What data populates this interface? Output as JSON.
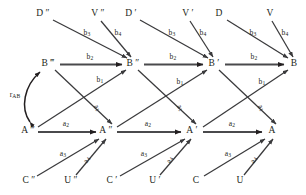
{
  "figure": {
    "background_color": "#ffffff",
    "line_color": "#231f20",
    "text_color": "#231f20"
  },
  "nodes": [
    {
      "id": "D2",
      "label": "D ″",
      "x": 43,
      "y": 14
    },
    {
      "id": "V2",
      "label": "V ″",
      "x": 98,
      "y": 14
    },
    {
      "id": "D1",
      "label": "D ′",
      "x": 131,
      "y": 14
    },
    {
      "id": "V1",
      "label": "V ′",
      "x": 188,
      "y": 14
    },
    {
      "id": "D0",
      "label": "D",
      "x": 219,
      "y": 14
    },
    {
      "id": "V0",
      "label": "V",
      "x": 270,
      "y": 14
    },
    {
      "id": "B3",
      "label": "B ‴",
      "x": 48,
      "y": 64
    },
    {
      "id": "B2",
      "label": "B ″",
      "x": 133,
      "y": 64
    },
    {
      "id": "B1",
      "label": "B ′",
      "x": 214,
      "y": 64
    },
    {
      "id": "B0",
      "label": "B",
      "x": 294,
      "y": 64
    },
    {
      "id": "A3",
      "label": "A ‴",
      "x": 28,
      "y": 131
    },
    {
      "id": "A2",
      "label": "A ″",
      "x": 106,
      "y": 131
    },
    {
      "id": "A1",
      "label": "A ′",
      "x": 192,
      "y": 131
    },
    {
      "id": "A0",
      "label": "A",
      "x": 272,
      "y": 131
    },
    {
      "id": "C2",
      "label": "C ″",
      "x": 29,
      "y": 181
    },
    {
      "id": "U2",
      "label": "U ″",
      "x": 71,
      "y": 181
    },
    {
      "id": "C1",
      "label": "C ′",
      "x": 112,
      "y": 181
    },
    {
      "id": "U1",
      "label": "U ′",
      "x": 155,
      "y": 181
    },
    {
      "id": "C0",
      "label": "C",
      "x": 196,
      "y": 181
    },
    {
      "id": "U0",
      "label": "U",
      "x": 240,
      "y": 181
    }
  ],
  "edges": [
    {
      "id": "e-b2-3",
      "from": "B3",
      "to": "B2",
      "coef": "b",
      "sub": "2",
      "weight": "bold"
    },
    {
      "id": "e-b2-2",
      "from": "B2",
      "to": "B1",
      "coef": "b",
      "sub": "2",
      "weight": "bold"
    },
    {
      "id": "e-b2-1",
      "from": "B1",
      "to": "B0",
      "coef": "b",
      "sub": "2",
      "weight": "bold"
    },
    {
      "id": "e-a2-3",
      "from": "A3",
      "to": "A2",
      "coef": "a",
      "sub": "2",
      "weight": "bold"
    },
    {
      "id": "e-a2-2",
      "from": "A2",
      "to": "A1",
      "coef": "a",
      "sub": "2",
      "weight": "bold"
    },
    {
      "id": "e-a2-1",
      "from": "A1",
      "to": "A0",
      "coef": "a",
      "sub": "2",
      "weight": "bold"
    },
    {
      "id": "e-b1-3",
      "from": "A3",
      "to": "B2",
      "coef": "b",
      "sub": "1",
      "weight": "thin"
    },
    {
      "id": "e-b1-2",
      "from": "A2",
      "to": "B1",
      "coef": "b",
      "sub": "1",
      "weight": "thin"
    },
    {
      "id": "e-b1-1",
      "from": "A1",
      "to": "B0",
      "coef": "b",
      "sub": "1",
      "weight": "thin"
    },
    {
      "id": "e-a1-3",
      "from": "B3",
      "to": "A2",
      "coef": "a",
      "sub": "1",
      "weight": "thin"
    },
    {
      "id": "e-a1-2",
      "from": "B2",
      "to": "A1",
      "coef": "a",
      "sub": "1",
      "weight": "thin"
    },
    {
      "id": "e-a1-1",
      "from": "B1",
      "to": "A0",
      "coef": "a",
      "sub": "1",
      "weight": "thin"
    },
    {
      "id": "e-b3-3",
      "from": "D2",
      "to": "B2",
      "coef": "b",
      "sub": "3",
      "weight": "thin"
    },
    {
      "id": "e-b3-2",
      "from": "D1",
      "to": "B1",
      "coef": "b",
      "sub": "3",
      "weight": "thin"
    },
    {
      "id": "e-b3-1",
      "from": "D0",
      "to": "B0",
      "coef": "b",
      "sub": "3",
      "weight": "thin"
    },
    {
      "id": "e-b4-3",
      "from": "V2",
      "to": "B2",
      "coef": "b",
      "sub": "4",
      "weight": "thin"
    },
    {
      "id": "e-b4-2",
      "from": "V1",
      "to": "B1",
      "coef": "b",
      "sub": "4",
      "weight": "thin"
    },
    {
      "id": "e-b4-1",
      "from": "V0",
      "to": "B0",
      "coef": "b",
      "sub": "4",
      "weight": "thin"
    },
    {
      "id": "e-a3-3",
      "from": "C2",
      "to": "A2",
      "coef": "a",
      "sub": "3",
      "weight": "thin"
    },
    {
      "id": "e-a3-2",
      "from": "C1",
      "to": "A1",
      "coef": "a",
      "sub": "3",
      "weight": "thin"
    },
    {
      "id": "e-a3-1",
      "from": "C0",
      "to": "A0",
      "coef": "a",
      "sub": "3",
      "weight": "thin"
    },
    {
      "id": "e-a4-3",
      "from": "U2",
      "to": "A2",
      "coef": "a",
      "sub": "4",
      "weight": "thin"
    },
    {
      "id": "e-a4-2",
      "from": "U1",
      "to": "A1",
      "coef": "a",
      "sub": "4",
      "weight": "thin"
    },
    {
      "id": "e-a4-1",
      "from": "U0",
      "to": "A0",
      "coef": "a",
      "sub": "4",
      "weight": "thin"
    },
    {
      "id": "e-rab",
      "from": "A3",
      "to": "B3",
      "coef": "r",
      "sub": "AB",
      "weight": "thin",
      "style": "curved-double"
    }
  ],
  "edge_labels": {
    "b2_col3": {
      "text": "b",
      "sub": "2",
      "x": 90,
      "y": 57
    },
    "b2_col2": {
      "text": "b",
      "sub": "2",
      "x": 173,
      "y": 57
    },
    "b2_col1": {
      "text": "b",
      "sub": "2",
      "x": 254,
      "y": 57
    },
    "a2_col3": {
      "text": "a",
      "sub": "2",
      "x": 66,
      "y": 124
    },
    "a2_col2": {
      "text": "a",
      "sub": "2",
      "x": 148,
      "y": 124
    },
    "a2_col1": {
      "text": "a",
      "sub": "2",
      "x": 232,
      "y": 124
    },
    "b1_col3": {
      "text": "b",
      "sub": "1",
      "x": 100,
      "y": 80
    },
    "b1_col2": {
      "text": "b",
      "sub": "1",
      "x": 180,
      "y": 82
    },
    "b1_col1": {
      "text": "b",
      "sub": "1",
      "x": 262,
      "y": 82
    },
    "a1_col3": {
      "text": "a",
      "sub": "1",
      "x": 97,
      "y": 108
    },
    "a1_col2": {
      "text": "a",
      "sub": "1",
      "x": 180,
      "y": 108
    },
    "a1_col1": {
      "text": "a",
      "sub": "1",
      "x": 261,
      "y": 108
    },
    "b3_col3": {
      "text": "b",
      "sub": "3",
      "x": 87,
      "y": 33
    },
    "b3_col2": {
      "text": "b",
      "sub": "3",
      "x": 172,
      "y": 33
    },
    "b3_col1": {
      "text": "b",
      "sub": "3",
      "x": 253,
      "y": 33
    },
    "b4_col3": {
      "text": "b",
      "sub": "4",
      "x": 118,
      "y": 33
    },
    "b4_col2": {
      "text": "b",
      "sub": "4",
      "x": 203,
      "y": 33
    },
    "b4_col1": {
      "text": "b",
      "sub": "4",
      "x": 285,
      "y": 33
    },
    "a3_col3": {
      "text": "a",
      "sub": "3",
      "x": 63,
      "y": 154
    },
    "a3_col2": {
      "text": "a",
      "sub": "3",
      "x": 144,
      "y": 154
    },
    "a3_col1": {
      "text": "a",
      "sub": "3",
      "x": 228,
      "y": 154
    },
    "a4_col3": {
      "text": "a",
      "sub": "4",
      "x": 87,
      "y": 160
    },
    "a4_col2": {
      "text": "a",
      "sub": "4",
      "x": 170,
      "y": 160
    },
    "a4_col1": {
      "text": "a",
      "sub": "4",
      "x": 254,
      "y": 160
    },
    "r_ab": {
      "text": "r",
      "sub": "AB",
      "x": 15,
      "y": 95
    }
  }
}
